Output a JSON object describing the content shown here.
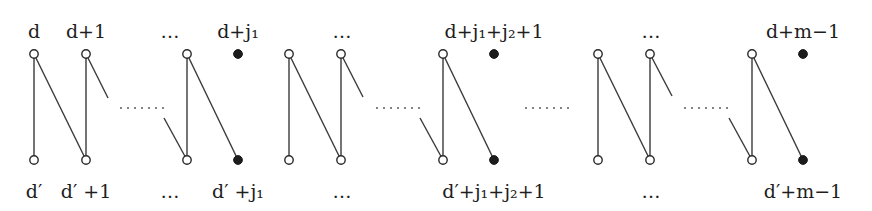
{
  "diagram": {
    "colors": {
      "line": "#3a3a3a",
      "filled_node": "#1c1c1c",
      "open_node": "#ffffff",
      "text": "#1e1e1e"
    },
    "rows": {
      "top_y": 54,
      "bottom_y": 160
    },
    "top_labels": [
      {
        "text": "d",
        "x": 34
      },
      {
        "text": "d+1",
        "x": 86
      },
      {
        "text": "…",
        "x": 145
      },
      {
        "text": "d+j₁",
        "x": 238
      },
      {
        "text": "…",
        "x": 347
      },
      {
        "text": "d+j₁+j₂+1",
        "x": 494
      },
      {
        "text": "…",
        "x": 652
      },
      {
        "text": "d+m−1",
        "x": 803
      }
    ],
    "bottom_labels": [
      {
        "text": "d′",
        "x": 34
      },
      {
        "text": "d′ +1",
        "x": 86
      },
      {
        "text": "…",
        "x": 145
      },
      {
        "text": "d′ +j₁",
        "x": 238
      },
      {
        "text": "…",
        "x": 347
      },
      {
        "text": "d′+j₁+j₂+1",
        "x": 494
      },
      {
        "text": "…",
        "x": 652
      },
      {
        "text": "d′+m−1",
        "x": 803
      }
    ],
    "groups": [
      {
        "columns": [
          34,
          86,
          187
        ],
        "filled_column": 238
      },
      {
        "columns": [
          289,
          341,
          443
        ],
        "filled_column": 494
      },
      {
        "columns": [
          598,
          650,
          752
        ],
        "filled_column": 803
      }
    ],
    "separator_dots": [
      {
        "x1": 525,
        "x2": 570,
        "y": 108
      }
    ]
  }
}
